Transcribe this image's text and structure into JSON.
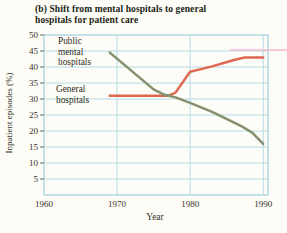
{
  "title": {
    "line1": "(b)  Shift from mental hospitals to general",
    "line2": "hospitals for patient care"
  },
  "chart_data": {
    "type": "line",
    "title": "(b) Shift from mental hospitals to general hospitals for patient care",
    "xlabel": "Year",
    "ylabel": "Inpatient episodes (%)",
    "xlim": [
      1960,
      1990
    ],
    "ylim": [
      0,
      50
    ],
    "x_ticks": [
      1960,
      1970,
      1980,
      1990
    ],
    "y_ticks": [
      5,
      10,
      15,
      20,
      25,
      30,
      35,
      40,
      45,
      50
    ],
    "grid": true,
    "legend_position": "labels-inside-plot",
    "series": [
      {
        "name": "Public mental hospitals",
        "label_lines": [
          "Public",
          "mental",
          "hospitals"
        ],
        "color": "#84906f",
        "points": [
          [
            1969,
            44.5
          ],
          [
            1975,
            33
          ],
          [
            1976.5,
            31.3
          ],
          [
            1978,
            30.5
          ],
          [
            1980,
            28.8
          ],
          [
            1983,
            26
          ],
          [
            1987,
            21.5
          ],
          [
            1988.5,
            19.5
          ],
          [
            1990,
            16
          ]
        ]
      },
      {
        "name": "General hospitals",
        "label_lines": [
          "General",
          "hospitals"
        ],
        "color": "#dd6850",
        "points": [
          [
            1969,
            31
          ],
          [
            1977,
            31
          ],
          [
            1978,
            32
          ],
          [
            1980,
            38.5
          ],
          [
            1983,
            40.2
          ],
          [
            1986,
            42.2
          ],
          [
            1987.5,
            43
          ],
          [
            1990,
            43
          ]
        ]
      }
    ],
    "artifact_line": {
      "description": "pink print-artifact line near top right at the 45 gridline",
      "color": "#f3b9d0",
      "y_value": 45,
      "x_start_year": 1985.5,
      "extends_to_right_edge": true
    }
  },
  "colors": {
    "background": "#fdfcf6",
    "grid": "#b4dbe8",
    "frame": "#9fcfe0",
    "title_text": "#201e15",
    "tick_text": "#33312a",
    "series_green": "#84906f",
    "series_orange": "#dd6850",
    "artifact_pink": "#f3b9d0"
  }
}
